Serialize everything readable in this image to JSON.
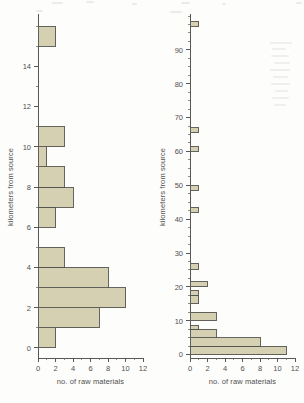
{
  "figure": {
    "background_color": "#fdfdfc",
    "bar_fill_color": "#d6d0b2",
    "bar_stroke_color": "#54544f",
    "axis_color": "#585856",
    "text_color": "#4f4f4d"
  },
  "panels": [
    {
      "id": "left",
      "name": "left-histogram",
      "chart_index": 0
    },
    {
      "id": "right",
      "name": "right-histogram",
      "chart_index": 1
    }
  ],
  "chart_data": [
    {
      "type": "bar",
      "orientation": "horizontal",
      "title": "",
      "xlabel": "no. of raw materials",
      "ylabel": "kilometers from source",
      "xlim": [
        0,
        12
      ],
      "ylim": [
        -0.5,
        16.5
      ],
      "xticks": [
        0,
        2,
        4,
        6,
        8,
        10,
        12
      ],
      "xtick_labels": [
        "0",
        "2",
        "4",
        "6",
        "8",
        "10",
        "12"
      ],
      "yticks": [
        0,
        2,
        4,
        6,
        8,
        10,
        12,
        14
      ],
      "ytick_labels": [
        "0",
        "2",
        "4",
        "6",
        "8",
        "10",
        "12",
        "14"
      ],
      "y_minor_step": 1,
      "grid": false,
      "legend": false,
      "bin_width": 1,
      "bins": [
        {
          "y_low": 0,
          "y_high": 1,
          "value": 2
        },
        {
          "y_low": 1,
          "y_high": 2,
          "value": 7
        },
        {
          "y_low": 2,
          "y_high": 3,
          "value": 10
        },
        {
          "y_low": 3,
          "y_high": 4,
          "value": 8
        },
        {
          "y_low": 4,
          "y_high": 5,
          "value": 3
        },
        {
          "y_low": 6,
          "y_high": 7,
          "value": 2
        },
        {
          "y_low": 7,
          "y_high": 8,
          "value": 4
        },
        {
          "y_low": 8,
          "y_high": 9,
          "value": 3
        },
        {
          "y_low": 9,
          "y_high": 10,
          "value": 1
        },
        {
          "y_low": 10,
          "y_high": 11,
          "value": 3
        },
        {
          "y_low": 15,
          "y_high": 16,
          "value": 2
        }
      ]
    },
    {
      "type": "bar",
      "orientation": "horizontal",
      "title": "",
      "xlabel": "no. of raw materials",
      "ylabel": "kilometers from source",
      "xlim": [
        0,
        12
      ],
      "ylim": [
        -1,
        100
      ],
      "xticks": [
        0,
        2,
        4,
        6,
        8,
        10,
        12
      ],
      "xtick_labels": [
        "0",
        "2",
        "4",
        "6",
        "8",
        "10",
        "12"
      ],
      "yticks": [
        0,
        10,
        20,
        30,
        40,
        50,
        60,
        70,
        80,
        90
      ],
      "ytick_labels": [
        "0",
        "10",
        "20",
        "30",
        "40",
        "50",
        "60",
        "70",
        "80",
        "90"
      ],
      "y_minor_step": 2.5,
      "grid": false,
      "legend": false,
      "bin_width": 2.5,
      "bins": [
        {
          "y_low": 0,
          "y_high": 2.5,
          "value": 11
        },
        {
          "y_low": 2.5,
          "y_high": 5,
          "value": 8
        },
        {
          "y_low": 5,
          "y_high": 7.5,
          "value": 3
        },
        {
          "y_low": 7.5,
          "y_high": 8.5,
          "value": 1
        },
        {
          "y_low": 10,
          "y_high": 12.5,
          "value": 3
        },
        {
          "y_low": 15,
          "y_high": 17.5,
          "value": 1
        },
        {
          "y_low": 17.5,
          "y_high": 19,
          "value": 1
        },
        {
          "y_low": 20,
          "y_high": 21.5,
          "value": 2
        },
        {
          "y_low": 25,
          "y_high": 27,
          "value": 1
        },
        {
          "y_low": 42,
          "y_high": 43.5,
          "value": 1
        },
        {
          "y_low": 48.5,
          "y_high": 50,
          "value": 1
        },
        {
          "y_low": 60,
          "y_high": 61.5,
          "value": 1
        },
        {
          "y_low": 65.5,
          "y_high": 67,
          "value": 1
        },
        {
          "y_low": 97,
          "y_high": 98.5,
          "value": 1
        }
      ]
    }
  ]
}
